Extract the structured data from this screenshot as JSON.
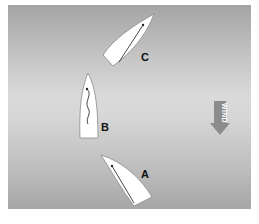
{
  "diagram": {
    "colors": {
      "background": "#ffffff",
      "water_gradient": [
        "#a4a4a4",
        "#dadada",
        "#a6a6a6"
      ],
      "hull": "#ffffff",
      "hull_outline": "#8a8a8a",
      "sail_line": "#333333",
      "wind_arrow": "#8c8c8c",
      "label": "#111111"
    },
    "boats": [
      {
        "id": "C",
        "label": "C",
        "heading": "up-right (close-hauled)",
        "sail": "sheeted in"
      },
      {
        "id": "B",
        "label": "B",
        "heading": "head to wind",
        "sail": "luffing"
      },
      {
        "id": "A",
        "label": "A",
        "heading": "up-left (close-hauled)",
        "sail": "sheeted in"
      }
    ],
    "wind": {
      "label": "WIND",
      "direction": "down"
    }
  }
}
